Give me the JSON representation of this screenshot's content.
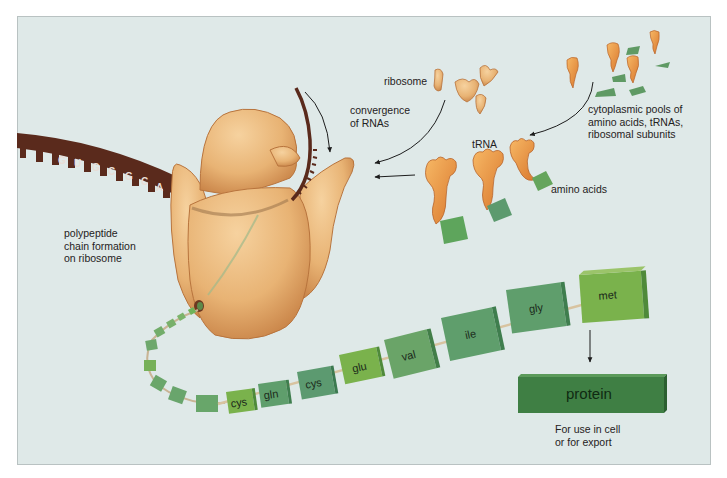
{
  "figure": {
    "colors": {
      "background": "#dfe9e8",
      "frame_border": "#b9c2c2",
      "ribosome": "#e9b77c",
      "ribosome_shadow": "#c98a4e",
      "mrna": "#5a2a1c",
      "amino_acid_light": "#7fb04f",
      "amino_acid_mid": "#6aa06a",
      "amino_acid_dark": "#5c9670",
      "protein": "#3f7f44",
      "trna": "#ec9a4a"
    }
  },
  "labels": {
    "ribosome": "ribosome",
    "convergence": "convergence\nof RNAs",
    "cytoplasmic_pools": "cytoplasmic pools of\namino acids, tRNAs,\nribosomal subunits",
    "trna": "tRNA",
    "amino_acids": "amino acids",
    "polypeptide": "polypeptide\nchain formation\non ribosome",
    "protein_use": "For use in cell\nor for export"
  },
  "mrna": {
    "bases": [
      "G",
      "U",
      "G",
      "C",
      "G",
      "C",
      "A",
      "G"
    ]
  },
  "chain": {
    "amino_acids": [
      "cys",
      "gln",
      "cys",
      "glu",
      "val",
      "ile",
      "gly",
      "met"
    ]
  },
  "protein": {
    "label": "protein"
  }
}
